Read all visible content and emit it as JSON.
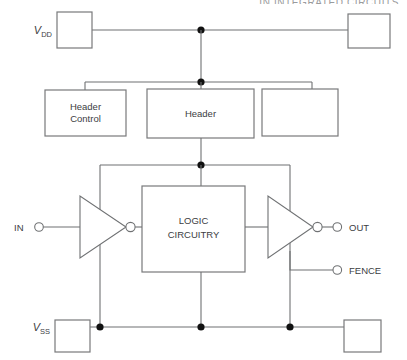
{
  "page": {
    "running_header": "IN INTEGRATED CIRCUITS"
  },
  "rails": {
    "vdd": {
      "symbol": "V",
      "subscript": "DD"
    },
    "vss": {
      "symbol": "V",
      "subscript": "SS"
    }
  },
  "blocks": {
    "vdd_left_box": {
      "label": ""
    },
    "vdd_right_box": {
      "label": ""
    },
    "header_control": {
      "line1": "Header",
      "line2": "Control"
    },
    "header": {
      "line1": "Header"
    },
    "header_third": {
      "label": ""
    },
    "logic": {
      "line1": "LOGIC",
      "line2": "CIRCUITRY"
    },
    "vss_left_box": {
      "label": ""
    },
    "vss_right_box": {
      "label": ""
    }
  },
  "terminals": {
    "input": {
      "label": "IN"
    },
    "output": {
      "label": "OUT"
    },
    "fence": {
      "label": "FENCE"
    }
  },
  "gates": {
    "input_inverter": {
      "type": "inverter"
    },
    "output_inverter": {
      "type": "inverter"
    }
  },
  "colors": {
    "wire": "#6f7173",
    "box_stroke": "#78797b",
    "junction": "#111111",
    "text": "#3c3d3f",
    "background": "#ffffff"
  }
}
